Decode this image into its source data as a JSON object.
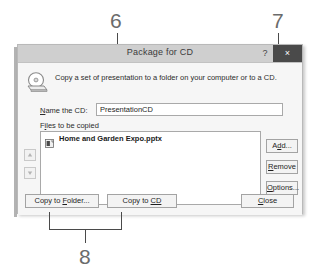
{
  "dialog": {
    "title": "Package for CD",
    "help_label": "?",
    "close_label": "×",
    "icon": "cd-disc-icon",
    "description": "Copy a set of presentation to a folder on your computer or to a CD.",
    "name_field": {
      "label_pre": "N",
      "label_post": "ame the CD:",
      "value": "PresentationCD",
      "placeholder": "PresentationCD"
    },
    "files_label": {
      "pre": "F",
      "acc": "i",
      "post": "les to be copied"
    },
    "file_list": [
      {
        "icon": "powerpoint-file-icon",
        "name": "Home and Garden Expo.pptx"
      }
    ],
    "move_buttons": [
      {
        "name": "move-up",
        "glyph": "▲"
      },
      {
        "name": "move-down",
        "glyph": "▼"
      }
    ],
    "side_buttons": [
      {
        "name": "add",
        "pre": "A",
        "acc": "d",
        "post": "d..."
      },
      {
        "name": "remove",
        "pre": "",
        "acc": "R",
        "post": "emove"
      },
      {
        "name": "options",
        "pre": "",
        "acc": "O",
        "post": "ptions..."
      }
    ],
    "bottom_buttons": {
      "copy_to_folder": {
        "pre": "Copy to ",
        "acc": "F",
        "post": "older..."
      },
      "copy_to_cd": {
        "pre": "Copy to ",
        "acc": "CD",
        "post": ""
      },
      "close": {
        "pre": "",
        "acc": "C",
        "post": "lose"
      }
    }
  },
  "annotations": [
    {
      "number": "6",
      "target": "name-the-cd-field"
    },
    {
      "number": "7",
      "target": "add-button"
    },
    {
      "number": "8",
      "target": "copy-to-folder-and-copy-to-cd-buttons"
    }
  ],
  "colors": {
    "titlebar": "#cfcfcf",
    "close_button": "#4a4a4a",
    "dialog_face": "#f6f6f6",
    "callout_text": "#6b6b6b",
    "leader_line": "#4a4a4a"
  }
}
